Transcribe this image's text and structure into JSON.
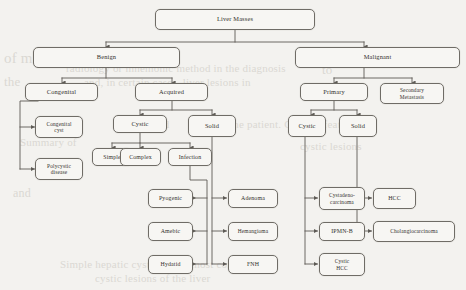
{
  "figure": {
    "type": "flowchart",
    "title": "Liver Masses",
    "orientation": "top-down",
    "background_color": "#f3f2ef",
    "node_border_color": "#6f6c66",
    "node_fill_color": "#f7f6f3",
    "connector_color": "#5d5a55"
  },
  "nodes": {
    "root": "Liver Masses",
    "benign": "Benign",
    "malignant": "Malignant",
    "congenital": "Congenital",
    "acquired": "Acquired",
    "primary": "Primary",
    "secondary": "Secondary\nMetastasis",
    "secondary_line1": "Secondary",
    "secondary_line2": "Metastasis",
    "congenital_cyst_line1": "Congenital",
    "congenital_cyst_line2": "cyst",
    "polycystic_line1": "Polycystic",
    "polycystic_line2": "disease",
    "benign_cystic": "Cystic",
    "benign_solid": "Solid",
    "simple": "Simple",
    "complex": "Complex",
    "infection": "Infection",
    "pyogenic": "Pyogenic",
    "amebic": "Amebic",
    "hydatid": "Hydatid",
    "adenoma": "Adenoma",
    "hemangioma": "Hemangioma",
    "fnh": "FNH",
    "malignant_cystic": "Cystic",
    "malignant_solid": "Solid",
    "cystadeno_line1": "Cystadeno-",
    "cystadeno_line2": "carcinoma",
    "ipmn_b": "IPMN-B",
    "cystic_hcc_line1": "Cystic",
    "cystic_hcc_line2": "HCC",
    "hcc": "HCC",
    "cholangiocarcinoma": "Cholangiocarcinoma"
  },
  "hierarchy": {
    "Liver Masses": [
      "Benign",
      "Malignant"
    ],
    "Benign": [
      "Congenital",
      "Acquired"
    ],
    "Congenital": [
      "Congenital cyst",
      "Polycystic disease"
    ],
    "Acquired": [
      "Cystic",
      "Solid"
    ],
    "Acquired > Cystic": [
      "Simple",
      "Complex",
      "Infection"
    ],
    "Infection": [
      "Pyogenic",
      "Amebic",
      "Hydatid"
    ],
    "Acquired > Solid": [
      "Adenoma",
      "Hemangioma",
      "FNH"
    ],
    "Malignant": [
      "Primary",
      "Secondary Metastasis"
    ],
    "Primary": [
      "Cystic",
      "Solid"
    ],
    "Primary > Cystic": [
      "Cystadeno-carcinoma",
      "IPMN-B",
      "Cystic HCC"
    ],
    "Primary > Solid": [
      "HCC",
      "Cholangiocarcinoma"
    ]
  },
  "ghost_text": [
    {
      "text": "of malignant",
      "x": 4,
      "y": 50,
      "size": 15
    },
    {
      "text": "radiology or mnemonic method in the diagnosis",
      "x": 66,
      "y": 62,
      "size": 11
    },
    {
      "text": "and, in certain cases, liver lesions in",
      "x": 84,
      "y": 76,
      "size": 11
    },
    {
      "text": "the",
      "x": 4,
      "y": 74,
      "size": 13
    },
    {
      "text": "to",
      "x": 322,
      "y": 62,
      "size": 13
    },
    {
      "text": "lesions and",
      "x": 118,
      "y": 118,
      "size": 11
    },
    {
      "text": "the patient. Clinical features",
      "x": 230,
      "y": 118,
      "size": 11
    },
    {
      "text": "Summary of",
      "x": 20,
      "y": 136,
      "size": 11
    },
    {
      "text": "cystic lesions",
      "x": 300,
      "y": 140,
      "size": 11
    },
    {
      "text": "and",
      "x": 13,
      "y": 186,
      "size": 12
    },
    {
      "text": "Simple hepatic cysts are the most common",
      "x": 60,
      "y": 258,
      "size": 11
    },
    {
      "text": "cystic lesions of the liver",
      "x": 95,
      "y": 272,
      "size": 11
    },
    {
      "text": "liver",
      "x": 400,
      "y": 230,
      "size": 11
    }
  ]
}
